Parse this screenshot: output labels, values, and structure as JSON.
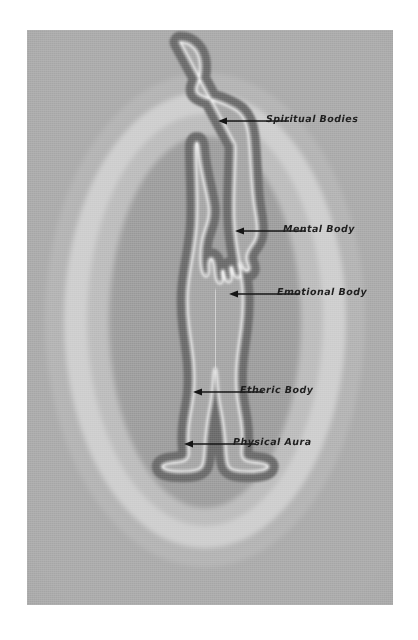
{
  "diagram": {
    "type": "aura-layers-anatomy",
    "background_color": "#a8a8a8",
    "plate": {
      "x": 27,
      "y": 30,
      "width": 366,
      "height": 575
    },
    "layers": [
      {
        "id": "spiritual-bodies",
        "label": "Spiritual Bodies",
        "order": 1,
        "color": "#b4b4b4",
        "description": "outermost halo ring"
      },
      {
        "id": "mental-body",
        "label": "Mental Body",
        "order": 2,
        "color": "#cfcfcf",
        "description": "bright pale ring"
      },
      {
        "id": "emotional-body",
        "label": "Emotional Body",
        "order": 3,
        "color": "#bdbdbd",
        "description": "mid ring"
      },
      {
        "id": "etheric-body",
        "label": "Etheric Body",
        "order": 4,
        "color": "#9d9d9d",
        "description": "inner ring hugging the body"
      },
      {
        "id": "physical-aura",
        "label": "Physical Aura",
        "order": 5,
        "color": "#6b6b6b",
        "description": "dark band outlining the physical body"
      }
    ],
    "body_outline_color": "#f4f4f4",
    "body_fill_color": "#a3a3a3",
    "labels": [
      {
        "id": "spiritual-bodies",
        "text": "Spiritual Bodies",
        "text_x": 266,
        "text_y": 114,
        "arrow_tip_x": 221,
        "arrow_tip_y": 121,
        "arrow_tail_x": 262,
        "arrow_tail_y": 121
      },
      {
        "id": "mental-body",
        "text": "Mental Body",
        "text_x": 283,
        "text_y": 224,
        "arrow_tip_x": 238,
        "arrow_tip_y": 231,
        "arrow_tail_x": 279,
        "arrow_tail_y": 231
      },
      {
        "id": "emotional-body",
        "text": "Emotional Body",
        "text_x": 277,
        "text_y": 287,
        "arrow_tip_x": 232,
        "arrow_tip_y": 294,
        "arrow_tail_x": 273,
        "arrow_tail_y": 294
      },
      {
        "id": "etheric-body",
        "text": "Etheric Body",
        "text_x": 240,
        "text_y": 385,
        "arrow_tip_x": 196,
        "arrow_tip_y": 392,
        "arrow_tail_x": 236,
        "arrow_tail_y": 392
      },
      {
        "id": "physical-aura",
        "text": "Physical Aura",
        "text_x": 233,
        "text_y": 437,
        "arrow_tip_x": 187,
        "arrow_tip_y": 444,
        "arrow_tail_x": 229,
        "arrow_tail_y": 444
      }
    ],
    "arrow_color": "#141414"
  }
}
